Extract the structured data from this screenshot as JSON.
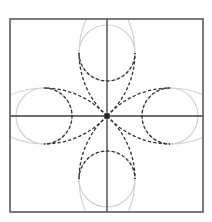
{
  "diagram": {
    "type": "geometric-construction",
    "description": "Four-petal quatrefoil construction: square frame with crosshair axes, four light-grey circles at cardinal positions, dashed petal outlines from the center, and light-grey continuation arcs to the frame edges",
    "colors": {
      "background": "#ffffff",
      "frame": "#5a5a5a",
      "axes": "#3c3c3c",
      "guide_circles": "#d2d2d2",
      "dashed_petals": "#333333",
      "center_point": "#222222"
    },
    "frame": {
      "x": 10,
      "y": 19,
      "width": 193,
      "height": 193
    },
    "center": {
      "x": 107,
      "y": 116
    },
    "circles": [
      {
        "name": "top",
        "cx": 107,
        "cy": 53,
        "r": 28
      },
      {
        "name": "right",
        "cx": 170,
        "cy": 116,
        "r": 28
      },
      {
        "name": "bottom",
        "cx": 107,
        "cy": 179,
        "r": 28
      },
      {
        "name": "left",
        "cx": 44,
        "cy": 116,
        "r": 28
      }
    ],
    "petal_arc_radius": 85,
    "labels": []
  }
}
